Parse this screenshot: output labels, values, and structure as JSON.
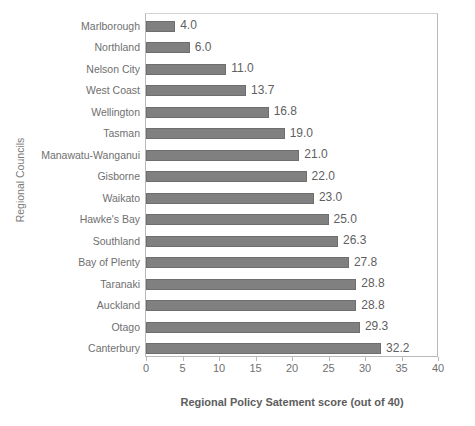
{
  "chart_data": {
    "type": "bar",
    "orientation": "horizontal",
    "title": "",
    "xlabel": "Regional Policy Satement score (out of 40)",
    "ylabel": "Regional Councils",
    "xlim": [
      0,
      40
    ],
    "xticks": [
      0,
      5,
      10,
      15,
      20,
      25,
      30,
      35,
      40
    ],
    "grid": false,
    "legend": false,
    "bar_color": "#808080",
    "bar_edge_color": "#6e6e6e",
    "frame_color": "#b9b9b9",
    "categories": [
      "Marlborough",
      "Northland",
      "Nelson City",
      "West Coast",
      "Wellington",
      "Tasman",
      "Manawatu-Wanganui",
      "Gisborne",
      "Waikato",
      "Hawke's Bay",
      "Southland",
      "Bay of Plenty",
      "Taranaki",
      "Auckland",
      "Otago",
      "Canterbury"
    ],
    "values": [
      4.0,
      6.0,
      11.0,
      13.7,
      16.8,
      19.0,
      21.0,
      22.0,
      23.0,
      25.0,
      26.3,
      27.8,
      28.8,
      28.8,
      29.3,
      32.2
    ],
    "data_labels": [
      "4.0",
      "6.0",
      "11.0",
      "13.7",
      "16.8",
      "19.0",
      "21.0",
      "22.0",
      "23.0",
      "25.0",
      "26.3",
      "27.8",
      "28.8",
      "28.8",
      "29.3",
      "32.2"
    ]
  }
}
